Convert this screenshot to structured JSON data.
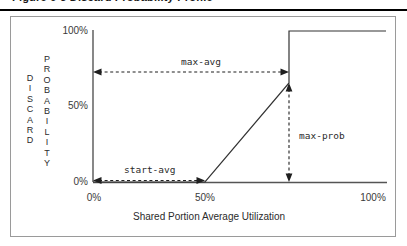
{
  "page": {
    "caption_partial": "Figure 6-3   Discard Probability Profile",
    "background": "#ffffff"
  },
  "figure": {
    "frame_color": "#9a9a9a"
  },
  "chart_data": {
    "type": "line",
    "title": "",
    "xlabel": "Shared Portion Average Utilization",
    "ylabel": "DISCARD PROBABILITY",
    "ylabel_words": [
      "DISCARD",
      "PROBABILITY"
    ],
    "xlim": [
      0,
      100
    ],
    "ylim": [
      0,
      100
    ],
    "xticks": [
      0,
      50,
      100
    ],
    "xticklabels": [
      "0%",
      "50%",
      "100%"
    ],
    "yticks": [
      0,
      50,
      100
    ],
    "yticklabels": [
      "0%",
      "50%",
      "100%"
    ],
    "grid": false,
    "legend": null,
    "series": [
      {
        "name": "discard probability profile",
        "x": [
          0,
          40,
          70,
          70,
          104
        ],
        "y": [
          0,
          0,
          67,
          100,
          100
        ],
        "color": "#333333"
      }
    ],
    "annotations": [
      {
        "label": "max-avg",
        "kind": "horizontal-double-arrow",
        "x_from": 0,
        "x_to": 70,
        "y": 74,
        "style": "dashed"
      },
      {
        "label": "start-avg",
        "kind": "horizontal-double-arrow",
        "x_from": 0,
        "x_to": 40,
        "y": 0,
        "style": "dashed"
      },
      {
        "label": "max-prob",
        "kind": "vertical-double-arrow",
        "x": 70,
        "y_from": 0,
        "y_to": 67,
        "style": "dashed"
      }
    ]
  },
  "axis_labels": {
    "y_100": "100%",
    "y_50": "50%",
    "y_0": "0%",
    "x_0": "0%",
    "x_50": "50%",
    "x_100": "100%",
    "x_title": "Shared Portion Average Utilization"
  },
  "vertical_labels": {
    "discard": "DISCARD",
    "probability": "PROBABILITY"
  },
  "annotation_labels": {
    "max_avg": "max-avg",
    "start_avg": "start-avg",
    "max_prob": "max-prob"
  },
  "colors": {
    "line": "#333333",
    "axis": "#555555",
    "annotation": "#1f1f1f",
    "text": "#2b2b2b",
    "frame": "#9a9a9a",
    "rule": "#000000"
  }
}
